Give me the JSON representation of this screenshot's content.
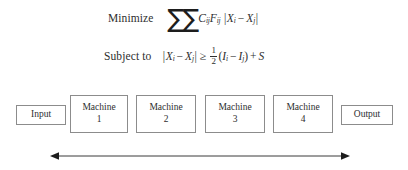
{
  "diagram": {
    "background_color": "#ffffff",
    "line_color": "#8c8c8c",
    "text_color": "#2e2e2e"
  },
  "formula": {
    "objective": {
      "label": "Minimize",
      "sigma": "∑",
      "coefficient": "C",
      "coefficient_sub": "ij",
      "flow": "F",
      "flow_sub": "ij",
      "abs_open": "|",
      "var1": "X",
      "var1_sub": "i",
      "minus": "−",
      "var2": "X",
      "var2_sub": "j",
      "abs_close": "|",
      "plain_text": "Minimize ∑∑ Cij Fij |Xi − Xj|"
    },
    "constraint": {
      "label": "Subject to",
      "abs_open": "|",
      "var1": "X",
      "var1_sub": "i",
      "minus1": "−",
      "var2": "X",
      "var2_sub": "j",
      "abs_close": "|",
      "relation": "≥",
      "fraction_numerator": "1",
      "fraction_denominator": "2",
      "paren_open": "(",
      "length1": "I",
      "length1_sub": "i",
      "minus2": "−",
      "length2": "I",
      "length2_sub": "j",
      "paren_close": ")",
      "plus": "+",
      "clearance": "S",
      "plain_text": "Subject to |Xi − Xj| ≥ 1/2 (Ii − Ij) + S"
    }
  },
  "layout_row": {
    "nodes": [
      {
        "id": "input",
        "line1": "Input",
        "line2": "",
        "type": "terminal",
        "x": 16,
        "width": 50
      },
      {
        "id": "machine1",
        "line1": "Machine",
        "line2": "1",
        "type": "machine",
        "x": 70,
        "width": 58
      },
      {
        "id": "machine2",
        "line1": "Machine",
        "line2": "2",
        "type": "machine",
        "x": 136,
        "width": 60
      },
      {
        "id": "machine3",
        "line1": "Machine",
        "line2": "3",
        "type": "machine",
        "x": 205,
        "width": 60
      },
      {
        "id": "machine4",
        "line1": "Machine",
        "line2": "4",
        "type": "machine",
        "x": 273,
        "width": 60
      },
      {
        "id": "output",
        "line1": "Output",
        "line2": "",
        "type": "terminal",
        "x": 341,
        "width": 52
      }
    ]
  },
  "span_arrow": {
    "name": "total-length-double-arrow",
    "label": "",
    "start_x": 55,
    "end_x": 342,
    "y": 156
  }
}
